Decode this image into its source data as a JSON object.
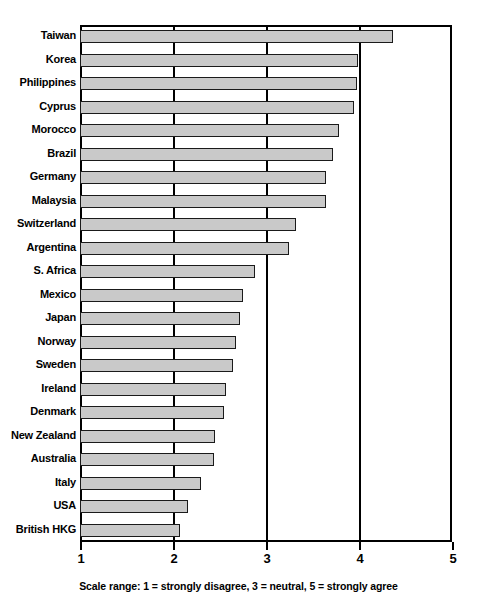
{
  "chart_data": {
    "type": "bar",
    "orientation": "horizontal",
    "title": "",
    "subtitle": "",
    "xlabel": "Scale range: 1 = strongly disagree, 3 = neutral, 5 = strongly agree",
    "ylabel": "",
    "xlim": [
      1,
      5
    ],
    "xticks": [
      1,
      2,
      3,
      4,
      5
    ],
    "xtick_labels": [
      "1",
      "2",
      "3",
      "4",
      "5"
    ],
    "grid": true,
    "gridlines_x": [
      2,
      3,
      4
    ],
    "legend": null,
    "bar_fill_color": "#c9c9c9",
    "bar_edge_color": "#1a1a1a",
    "categories": [
      "Taiwan",
      "Korea",
      "Philippines",
      "Cyprus",
      "Morocco",
      "Brazil",
      "Germany",
      "Malaysia",
      "Switzerland",
      "Argentina",
      "S. Africa",
      "Mexico",
      "Japan",
      "Norway",
      "Sweden",
      "Ireland",
      "Denmark",
      "New Zealand",
      "Australia",
      "Italy",
      "USA",
      "British HKG"
    ],
    "values": [
      4.37,
      3.99,
      3.98,
      3.95,
      3.79,
      3.72,
      3.65,
      3.64,
      3.32,
      3.25,
      2.88,
      2.75,
      2.72,
      2.68,
      2.65,
      2.57,
      2.55,
      2.45,
      2.44,
      2.3,
      2.16,
      2.07
    ]
  },
  "axis": {
    "caption": "Scale range: 1 = strongly disagree, 3 = neutral, 5 = strongly agree"
  }
}
